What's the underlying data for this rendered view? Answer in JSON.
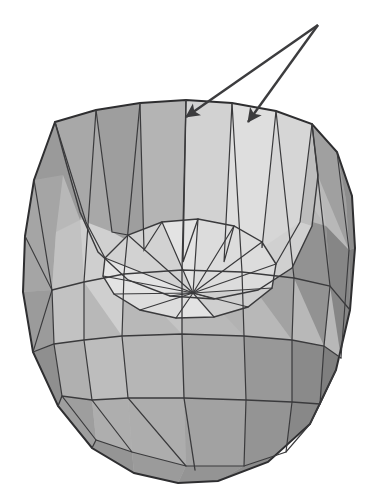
{
  "figure": {
    "background_color": "#ffffff",
    "width": 376,
    "height": 493,
    "caption_clipped_text": "FLOW BOTTOM",
    "caption_color": "#e9e9ec"
  },
  "object": {
    "name": "faceted-bowl-mesh",
    "description": "Shaded 3D polygonal bowl / crucible viewed obliquely from above, wireframe mesh visible",
    "center_x": 189,
    "center_y": 300,
    "interior_center_x": 193,
    "interior_center_y": 293,
    "rim_top_y": 100,
    "base_bottom_y": 483,
    "left_extent_x": 22,
    "right_extent_x": 355,
    "radial_spokes": 16,
    "latitude_bands": 4
  },
  "palette": {
    "edge_line": "#3a3a3c",
    "outline": "#2e2e30",
    "shade_lightest": "#ededed",
    "shade_light": "#dcdcdc",
    "shade_mid_light": "#cbcbcb",
    "shade_mid": "#b4b4b4",
    "shade_mid_dark": "#9e9e9e",
    "shade_dark": "#8c8c8c",
    "shade_darkest": "#7a7a7a"
  },
  "annotations": {
    "arrows": [
      {
        "id": "arrow-left",
        "label": "leader-arrow-to-left-inner-wall",
        "tail_x": 318,
        "tail_y": 25,
        "tip_x": 184,
        "tip_y": 118,
        "color": "#3c3c3e"
      },
      {
        "id": "arrow-right",
        "label": "leader-arrow-to-right-inner-wall",
        "tail_x": 318,
        "tail_y": 25,
        "tip_x": 246,
        "tip_y": 123,
        "color": "#3c3c3e"
      }
    ]
  }
}
